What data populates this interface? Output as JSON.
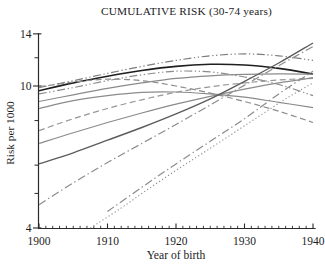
{
  "chart_data": {
    "type": "line",
    "title": "CUMULATIVE RISK (30-74 years)",
    "xlabel": "Year of birth",
    "ylabel": "Risk per 1000",
    "x_axis": {
      "min": 1900,
      "max": 1940,
      "ticks_major": [
        1900,
        1910,
        1920,
        1930,
        1940
      ],
      "ticks_minor_step": 1
    },
    "y_axis": {
      "min": 4,
      "max": 14,
      "scale": "log",
      "ticks_major": [
        14,
        10,
        4
      ],
      "ticks_minor": [
        12,
        8,
        6,
        5
      ]
    },
    "grid": false,
    "legend": "none",
    "series": [
      {
        "name": "black-solid-peak",
        "style": "solid",
        "color": "#1f1f1f",
        "width": 1.6,
        "x": [
          1900,
          1905,
          1910,
          1915,
          1920,
          1925,
          1930,
          1935,
          1940
        ],
        "y": [
          9.7,
          10.2,
          10.65,
          11.05,
          11.35,
          11.5,
          11.45,
          11.2,
          10.8
        ]
      },
      {
        "name": "dashdotdot-upper",
        "style": "dashdotdot",
        "color": "#7d7d7d",
        "width": 1.2,
        "x": [
          1900,
          1905,
          1910,
          1915,
          1920,
          1925,
          1930,
          1935,
          1940
        ],
        "y": [
          9.9,
          10.35,
          10.85,
          11.35,
          11.8,
          12.15,
          12.3,
          12.15,
          11.8
        ]
      },
      {
        "name": "dashdotdot-lower",
        "style": "dashdotdot",
        "color": "#8b8b8b",
        "width": 1.2,
        "x": [
          1900,
          1905,
          1910,
          1915,
          1920,
          1925,
          1930,
          1935,
          1940
        ],
        "y": [
          9.5,
          9.9,
          10.35,
          10.75,
          11.0,
          10.95,
          10.6,
          10.1,
          9.4
        ]
      },
      {
        "name": "dashed-upper",
        "style": "dashed",
        "color": "#8b8b8b",
        "width": 1.2,
        "x": [
          1900,
          1905,
          1910,
          1915,
          1920,
          1925,
          1930,
          1935,
          1940
        ],
        "y": [
          9.95,
          10.25,
          10.45,
          10.35,
          10.0,
          9.55,
          9.05,
          8.5,
          7.9
        ]
      },
      {
        "name": "solid-plateau",
        "style": "solid",
        "color": "#8b8b8b",
        "width": 1.2,
        "x": [
          1900,
          1905,
          1910,
          1915,
          1920,
          1925,
          1930,
          1935,
          1940
        ],
        "y": [
          9.05,
          9.45,
          9.85,
          10.2,
          10.5,
          10.68,
          10.78,
          10.82,
          10.8
        ]
      },
      {
        "name": "solid-hump",
        "style": "solid",
        "color": "#8b8b8b",
        "width": 1.2,
        "x": [
          1900,
          1905,
          1910,
          1915,
          1920,
          1925,
          1930,
          1935,
          1940
        ],
        "y": [
          8.65,
          9.1,
          9.4,
          9.6,
          9.62,
          9.5,
          9.3,
          9.0,
          8.7
        ]
      },
      {
        "name": "dashed-rising",
        "style": "dashed",
        "color": "#979797",
        "width": 1.2,
        "x": [
          1900,
          1905,
          1910,
          1915,
          1920,
          1925,
          1930,
          1935,
          1940
        ],
        "y": [
          7.5,
          8.1,
          8.65,
          9.15,
          9.6,
          9.95,
          10.2,
          10.4,
          10.5
        ]
      },
      {
        "name": "solid-rising",
        "style": "solid",
        "color": "#8b8b8b",
        "width": 1.2,
        "x": [
          1900,
          1905,
          1910,
          1915,
          1920,
          1925,
          1930,
          1935,
          1940
        ],
        "y": [
          6.9,
          7.4,
          7.9,
          8.4,
          8.9,
          9.35,
          9.8,
          10.2,
          10.55
        ]
      },
      {
        "name": "solid-steep",
        "style": "solid",
        "color": "#5c5c5c",
        "width": 1.4,
        "x": [
          1900,
          1905,
          1910,
          1915,
          1920,
          1925,
          1930,
          1935,
          1940
        ],
        "y": [
          6.05,
          6.5,
          7.05,
          7.65,
          8.35,
          9.2,
          10.3,
          11.6,
          13.2
        ]
      },
      {
        "name": "dashdot-steep",
        "style": "dashdot",
        "color": "#8b8b8b",
        "width": 1.2,
        "x": [
          1900,
          1905,
          1910,
          1915,
          1920,
          1925,
          1930,
          1935,
          1940
        ],
        "y": [
          4.65,
          5.35,
          6.1,
          6.9,
          7.8,
          8.85,
          10.05,
          11.4,
          12.9
        ]
      },
      {
        "name": "dashdot-late",
        "style": "dashdot",
        "color": "#8b8b8b",
        "width": 1.2,
        "x": [
          1910,
          1915,
          1920,
          1925,
          1930,
          1935,
          1940
        ],
        "y": [
          4.45,
          5.2,
          6.05,
          7.0,
          8.1,
          9.5,
          11.0
        ]
      },
      {
        "name": "dotted-rising",
        "style": "dotted",
        "color": "#8b8b8b",
        "width": 1.1,
        "x": [
          1907.5,
          1912,
          1916,
          1920,
          1924,
          1928,
          1932,
          1936,
          1940
        ],
        "y": [
          4.0,
          4.55,
          5.15,
          5.8,
          6.5,
          7.3,
          8.2,
          9.2,
          10.2
        ]
      }
    ]
  }
}
